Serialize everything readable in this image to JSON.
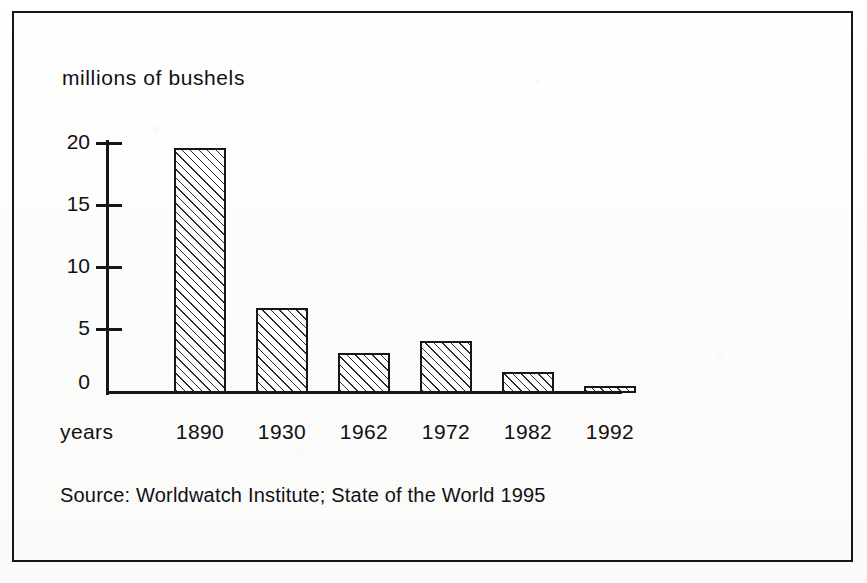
{
  "figure": {
    "axis_title": "millions of bushels",
    "years_label": "years",
    "source_note": "Source: Worldwatch Institute; State of the World 1995",
    "frame_color": "#15151a",
    "ink_color": "#101014",
    "hatch_color": "#2a2a30"
  },
  "chart_data": {
    "type": "bar",
    "title": "millions of bushels",
    "xlabel": "years",
    "ylabel": "millions of bushels",
    "categories": [
      "1890",
      "1930",
      "1962",
      "1972",
      "1982",
      "1992"
    ],
    "values": [
      19.6,
      6.8,
      3.2,
      4.2,
      1.7,
      0.6
    ],
    "ylim": [
      0,
      20
    ],
    "yticks": [
      0,
      5,
      10,
      15,
      20
    ],
    "ytick_labels": [
      "0",
      "5",
      "10",
      "15",
      "20"
    ],
    "grid": false,
    "legend": false,
    "bar_fill": "diagonal-hatch",
    "source": "Source: Worldwatch Institute; State of the World 1995"
  }
}
